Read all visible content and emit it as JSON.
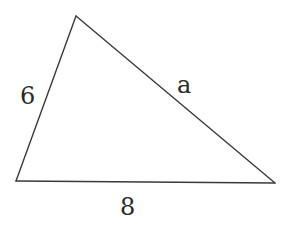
{
  "figure": {
    "shape": "triangle",
    "sides": {
      "left": "6",
      "right": "a",
      "bottom": "8"
    },
    "colors": {
      "stroke": "#3a3a3a",
      "label": "#2a2a2a",
      "background": "#ffffff"
    }
  }
}
